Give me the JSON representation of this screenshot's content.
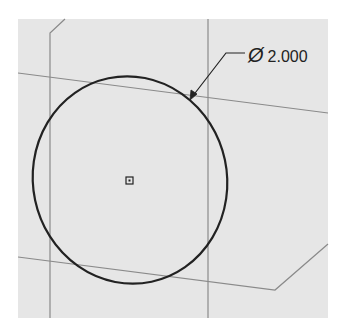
{
  "sketch": {
    "dimension": {
      "symbol": "Ø",
      "value": "2.000",
      "type": "diameter"
    },
    "colors": {
      "background": "#e6e6e6",
      "construction_line": "#8a8a8a",
      "geometry": "#222222"
    },
    "entities": [
      {
        "name": "circle",
        "center": [
          130,
          180
        ]
      },
      {
        "name": "center-point-marker"
      },
      {
        "name": "reference-plane-lines"
      }
    ]
  }
}
